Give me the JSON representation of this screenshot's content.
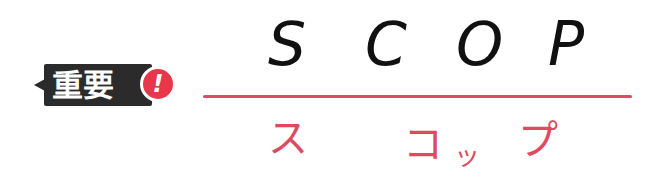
{
  "badge": {
    "label": "重要",
    "alert_symbol": "!",
    "background_color": "#2b2b2b",
    "alert_color": "#e8364b"
  },
  "term": {
    "english_letters": [
      "S",
      "C",
      "O",
      "P"
    ],
    "katakana": {
      "part1": "ス",
      "part2": "コ",
      "part3": "ッ",
      "part4": "プ"
    },
    "accent_color": "#e04a60",
    "text_color": "#111111"
  }
}
